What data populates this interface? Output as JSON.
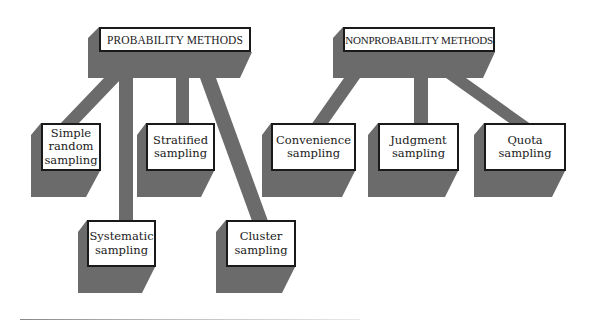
{
  "diagram": {
    "colors": {
      "shadow": "#6b6b6b",
      "box_fill": "#ffffff",
      "box_border": "#1a1a1a",
      "text": "#1a1a1a"
    },
    "groups": [
      {
        "title": "PROBABILITY METHODS",
        "children": [
          {
            "label": "Simple\nrandom\nsampling"
          },
          {
            "label": "Systematic\nsampling"
          },
          {
            "label": "Stratified\nsampling"
          },
          {
            "label": "Cluster\nsampling"
          }
        ]
      },
      {
        "title": "NONPROBABILITY METHODS",
        "children": [
          {
            "label": "Convenience\nsampling"
          },
          {
            "label": "Judgment\nsampling"
          },
          {
            "label": "Quota\nsampling"
          }
        ]
      }
    ]
  }
}
